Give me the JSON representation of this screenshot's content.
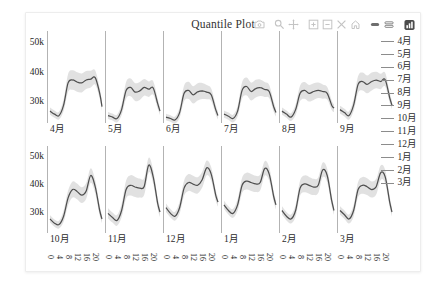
{
  "header": {
    "title": "Quantile Plot"
  },
  "toolbar": {
    "icons": [
      "camera-icon",
      "zoom-icon",
      "pan-icon",
      "zoom-in-icon",
      "zoom-out-icon",
      "autoscale-icon",
      "reset-axes-icon",
      "hover-closest-icon",
      "hover-compare-icon",
      "plotly-logo-icon"
    ]
  },
  "legend": {
    "items": [
      "4月",
      "5月",
      "6月",
      "7月",
      "8月",
      "9月",
      "10月",
      "11月",
      "12月",
      "1月",
      "2月",
      "3月"
    ],
    "line_color": "#8c8c8c"
  },
  "colors": {
    "line": "#4f4f4f",
    "band": "#c9c9c9",
    "axis": "#b3b3b3",
    "text": "#2e2e2e",
    "muted_icon": "#c4c4c4",
    "dark_icon": "#6e6e6e",
    "logo_bg": "#4a4a4a"
  },
  "chart_data": {
    "type": "line",
    "title": "Quantile Plot",
    "x": [
      0,
      2,
      4,
      6,
      8,
      10,
      12,
      14,
      16,
      18,
      20,
      22,
      23
    ],
    "xlim": [
      0,
      23
    ],
    "x_ticks": [
      "0",
      "4",
      "8",
      "12",
      "16",
      "20"
    ],
    "x_tick_values": [
      0,
      4,
      8,
      12,
      16,
      20
    ],
    "y_ticks": [
      "50k",
      "40k",
      "30k"
    ],
    "y_tick_values": [
      50,
      40,
      30
    ],
    "y_units": "thousands",
    "ylim": [
      23,
      54
    ],
    "facet_rows": [
      [
        "4月",
        "5月",
        "6月",
        "7月",
        "8月",
        "9月"
      ],
      [
        "10月",
        "11月",
        "12月",
        "1月",
        "2月",
        "3月"
      ]
    ],
    "facets": [
      {
        "label": "4月",
        "median": [
          27,
          26,
          25.5,
          29,
          36.5,
          37.5,
          36.8,
          36.5,
          37.5,
          37.8,
          38.3,
          33,
          28.5
        ],
        "spread": [
          1.2,
          1.2,
          1.3,
          2,
          3,
          3.3,
          3.3,
          3.2,
          3,
          2.8,
          2.4,
          1.8,
          1.4
        ]
      },
      {
        "label": "5月",
        "median": [
          25.5,
          25,
          24.5,
          27.5,
          34,
          35,
          33.4,
          33.8,
          35,
          34.4,
          34.8,
          29.5,
          27
        ],
        "spread": [
          1.2,
          1.2,
          1.3,
          1.9,
          2.8,
          3,
          3,
          3,
          2.8,
          2.6,
          2.3,
          1.7,
          1.3
        ]
      },
      {
        "label": "6月",
        "median": [
          25,
          24.5,
          24,
          26.5,
          33,
          34,
          32.5,
          33.5,
          33.8,
          33.4,
          32.5,
          27.5,
          25.5
        ],
        "spread": [
          1.1,
          1.1,
          1.2,
          1.7,
          2.6,
          2.9,
          2.9,
          2.9,
          2.7,
          2.4,
          2.1,
          1.6,
          1.3
        ]
      },
      {
        "label": "7月",
        "median": [
          26,
          25.3,
          24.5,
          27,
          34,
          35.3,
          33.6,
          34.6,
          34.9,
          34.3,
          33.6,
          28.5,
          26.5
        ],
        "spread": [
          1.2,
          1.2,
          1.3,
          1.8,
          2.7,
          3,
          3,
          3,
          2.8,
          2.5,
          2.2,
          1.7,
          1.3
        ]
      },
      {
        "label": "8月",
        "median": [
          27,
          26,
          25,
          27.5,
          33,
          34,
          33,
          33.6,
          34,
          33.6,
          33,
          29,
          28
        ],
        "spread": [
          1.2,
          1.2,
          1.3,
          1.8,
          2.6,
          2.8,
          2.8,
          2.8,
          2.6,
          2.4,
          2.1,
          1.6,
          1.3
        ]
      },
      {
        "label": "9月",
        "median": [
          27.5,
          26.5,
          25.5,
          29,
          36,
          37,
          36,
          37,
          37.5,
          37,
          37.6,
          31.5,
          29
        ],
        "spread": [
          1.3,
          1.3,
          1.4,
          2,
          2.8,
          3,
          3,
          3,
          2.8,
          2.6,
          2.3,
          1.7,
          1.4
        ]
      },
      {
        "label": "10月",
        "median": [
          28,
          26.5,
          26,
          29,
          35.5,
          38.5,
          37.8,
          36.5,
          38,
          43.5,
          39.5,
          31,
          28
        ],
        "spread": [
          1.3,
          1.3,
          1.4,
          2,
          2.6,
          2.8,
          2.8,
          2.8,
          2.8,
          2.6,
          2.4,
          1.8,
          1.5
        ]
      },
      {
        "label": "11月",
        "median": [
          30,
          28.5,
          27.5,
          31,
          38.5,
          40,
          39.4,
          39,
          39.6,
          47.2,
          43,
          33.5,
          30.5
        ],
        "spread": [
          1.8,
          1.8,
          1.9,
          2.4,
          3.2,
          3.6,
          3.6,
          3.4,
          3,
          2.6,
          2.5,
          2,
          1.8
        ]
      },
      {
        "label": "12月",
        "median": [
          32,
          30,
          29,
          32,
          39,
          41,
          40.4,
          40,
          42,
          46.2,
          44,
          36.5,
          34
        ],
        "spread": [
          1.5,
          1.5,
          1.6,
          2.1,
          2.7,
          3,
          3,
          2.9,
          2.8,
          2.6,
          2.4,
          1.9,
          1.6
        ]
      },
      {
        "label": "1月",
        "median": [
          33,
          31,
          30,
          33,
          40,
          41.5,
          41,
          40.5,
          41,
          46,
          44,
          36,
          33
        ],
        "spread": [
          1.5,
          1.5,
          1.6,
          2.1,
          2.7,
          3,
          3,
          2.9,
          2.8,
          2.6,
          2.4,
          1.9,
          1.6
        ]
      },
      {
        "label": "2月",
        "median": [
          31,
          29,
          28,
          31,
          39,
          40.5,
          40,
          39.4,
          40,
          45.5,
          43.5,
          34.5,
          31
        ],
        "spread": [
          1.5,
          1.5,
          1.6,
          2.1,
          2.7,
          3,
          3,
          2.9,
          2.8,
          2.6,
          2.4,
          1.9,
          1.6
        ]
      },
      {
        "label": "3月",
        "median": [
          31,
          29.5,
          28,
          31,
          38.5,
          40,
          39.5,
          38.5,
          39.5,
          44.5,
          43,
          34,
          30.5
        ],
        "spread": [
          1.5,
          1.5,
          1.6,
          2.1,
          2.7,
          3,
          3,
          2.9,
          2.8,
          2.6,
          2.4,
          1.9,
          1.6
        ]
      }
    ]
  }
}
